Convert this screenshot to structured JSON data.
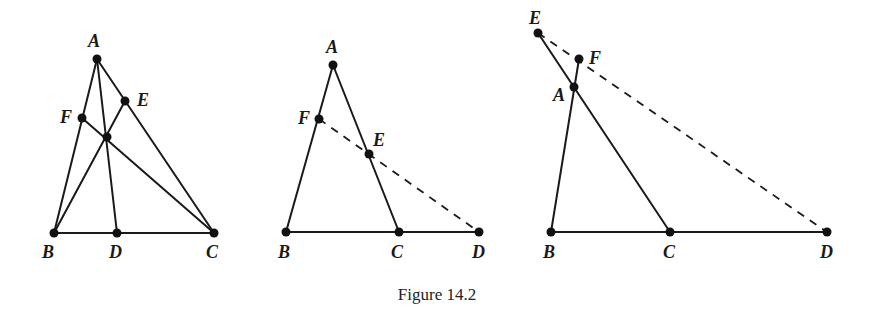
{
  "caption": "Figure 14.2",
  "figures": [
    {
      "id": "fig1",
      "description": "Triangle ABC with concurrent cevians AD, BE, CF",
      "labels": {
        "A": "A",
        "B": "B",
        "C": "C",
        "D": "D",
        "E": "E",
        "F": "F"
      }
    },
    {
      "id": "fig2",
      "description": "Triangle ABC with transversal FED (Menelaus), D on extension of BC",
      "labels": {
        "A": "A",
        "B": "B",
        "C": "C",
        "D": "D",
        "E": "E",
        "F": "F"
      }
    },
    {
      "id": "fig3",
      "description": "Triangle ABC with transversal through F, E, D all on extensions of sides",
      "labels": {
        "A": "A",
        "B": "B",
        "C": "C",
        "D": "D",
        "E": "E",
        "F": "F"
      }
    }
  ]
}
